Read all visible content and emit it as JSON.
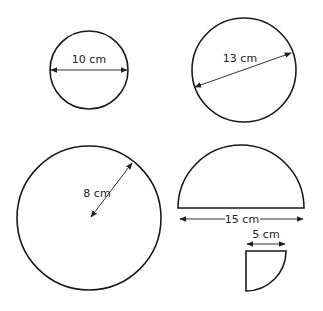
{
  "diagram": {
    "stroke_color": "#1a1a1a",
    "arrow_color": "#333333",
    "shapes": [
      {
        "id": "circle-diameter-10",
        "type": "circle",
        "measure": "diameter",
        "label": "10 cm"
      },
      {
        "id": "circle-diameter-13",
        "type": "circle",
        "measure": "diameter",
        "label": "13 cm"
      },
      {
        "id": "circle-radius-8",
        "type": "circle",
        "measure": "radius",
        "label": "8 cm"
      },
      {
        "id": "semicircle-diameter-15",
        "type": "semicircle",
        "measure": "diameter",
        "label": "15 cm"
      },
      {
        "id": "quarter-circle-radius-5",
        "type": "quarter-circle",
        "measure": "radius",
        "label": "5 cm"
      }
    ]
  }
}
